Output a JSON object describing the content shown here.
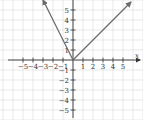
{
  "chart_data": {
    "type": "line",
    "title": "",
    "xlabel": "x",
    "ylabel": "y",
    "xlim": [
      -6,
      6.5
    ],
    "ylim": [
      -6,
      6
    ],
    "grid": true,
    "x_ticks": [
      -5,
      -4,
      -3,
      -2,
      -1,
      1,
      2,
      3,
      4,
      5
    ],
    "y_ticks": [
      -5,
      -4,
      -3,
      -2,
      -1,
      1,
      2,
      3,
      4,
      5
    ],
    "series": [
      {
        "name": "left branch (y = -2x, x <= 0)",
        "points": [
          [
            -3,
            6
          ],
          [
            0,
            0
          ]
        ],
        "arrow_at": "start"
      },
      {
        "name": "right branch (y = x, x >= 0)",
        "points": [
          [
            0,
            0
          ],
          [
            5.8,
            5.8
          ]
        ],
        "arrow_at": "end"
      }
    ],
    "colors": {
      "line": "#6b6b6b",
      "grid": "#d8d8d8",
      "axis": "#333333"
    }
  }
}
